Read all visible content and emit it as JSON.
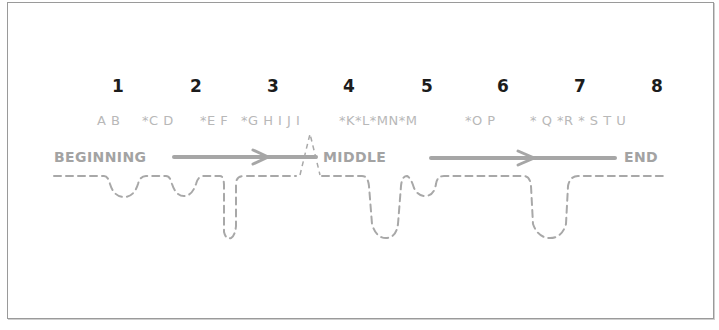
{
  "diagram": {
    "numbers": [
      {
        "label": "1",
        "x": 118
      },
      {
        "label": "2",
        "x": 196
      },
      {
        "label": "3",
        "x": 273
      },
      {
        "label": "4",
        "x": 349
      },
      {
        "label": "5",
        "x": 427
      },
      {
        "label": "6",
        "x": 503
      },
      {
        "label": "7",
        "x": 580
      },
      {
        "label": "8",
        "x": 657
      }
    ],
    "letters": [
      {
        "text": "A B",
        "x": 97
      },
      {
        "text": "*C D",
        "x": 142
      },
      {
        "text": "*E F",
        "x": 200
      },
      {
        "text": "*G H I J I",
        "x": 241
      },
      {
        "text": "*K*L*MN*M",
        "x": 339
      },
      {
        "text": "*O P",
        "x": 465
      },
      {
        "text": "* Q *R * S T U",
        "x": 530
      }
    ],
    "stages": {
      "beginning": "BEGINNING",
      "middle": "MIDDLE",
      "end": "END"
    },
    "colors": {
      "frame": "#9a9a9a",
      "numbers": "#1c1c1c",
      "letters": "#b8b8b8",
      "stage_labels": "#a3a3a3",
      "arrow": "#a6a6a6",
      "dashed_path": "#a8a8a8"
    }
  }
}
